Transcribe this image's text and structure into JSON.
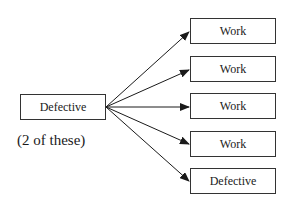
{
  "diagram": {
    "source": {
      "label": "Defective",
      "note": "(2 of these)"
    },
    "targets": [
      {
        "label": "Work"
      },
      {
        "label": "Work"
      },
      {
        "label": "Work"
      },
      {
        "label": "Work"
      },
      {
        "label": "Defective"
      }
    ],
    "colors": {
      "line": "#1a1a1a",
      "box_border": "#333333",
      "background": "#ffffff"
    }
  }
}
